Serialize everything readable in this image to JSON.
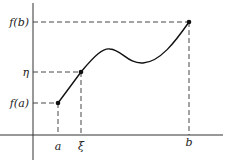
{
  "diagram": {
    "y_labels": {
      "fb": "f(b)",
      "eta": "η",
      "fa": "f(a)"
    },
    "x_labels": {
      "a": "a",
      "xi": "ξ",
      "b": "b"
    }
  }
}
